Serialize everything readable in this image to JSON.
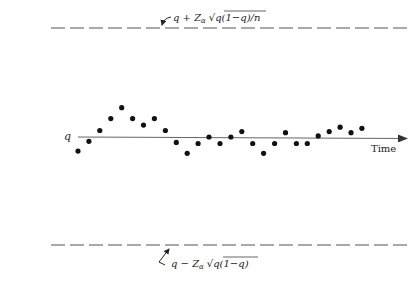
{
  "chart_data": {
    "type": "scatter",
    "title": "",
    "xlabel": "Time",
    "ylabel": "",
    "center_label": "q",
    "upper_limit_label": {
      "prefix": "q + Z",
      "subscript": "α",
      "radical": "q(1−q)/n"
    },
    "lower_limit_label": {
      "prefix": "q − Z",
      "subscript": "α",
      "radical": "q(1−q)"
    },
    "grid": false,
    "legend": "none",
    "ylim_relative": [
      -1,
      1
    ],
    "limits_note": "Upper and lower control limits drawn as dashed horizontal lines at +1 and -1 (relative units); center line q at 0",
    "x": [
      1,
      2,
      3,
      4,
      5,
      6,
      7,
      8,
      9,
      10,
      11,
      12,
      13,
      14,
      15,
      16,
      17,
      18,
      19,
      20,
      21,
      22,
      23,
      24,
      25,
      26,
      27
    ],
    "values": [
      -0.13,
      -0.04,
      0.06,
      0.17,
      0.27,
      0.17,
      0.11,
      0.17,
      0.06,
      -0.05,
      -0.15,
      -0.06,
      0.0,
      -0.06,
      0.0,
      0.05,
      -0.06,
      -0.15,
      -0.06,
      0.04,
      -0.06,
      -0.06,
      0.01,
      0.05,
      0.09,
      0.04,
      0.08
    ]
  },
  "colors": {
    "axis": "#555555",
    "dots": "#111111",
    "dashes": "#555555",
    "text": "#222222"
  },
  "geometry": {
    "center_y": 137,
    "unit_px": 108.5,
    "x_start": 78,
    "x_step": 10.92,
    "axis_x0": 78,
    "axis_x1": 407,
    "upper_y": 28,
    "lower_y": 245,
    "dash_x0": 51,
    "dash_x1": 410
  }
}
